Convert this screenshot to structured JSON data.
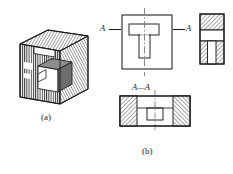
{
  "figure": {
    "type": "engineering-drawing",
    "captions": {
      "iso": "(a)",
      "ortho": "(b)"
    },
    "section_labels": {
      "left_marker": "A",
      "right_marker": "A",
      "section_title": "A—A"
    },
    "colors": {
      "line": "#1a1a1a",
      "hatch": "#2b2b2b",
      "background": "#ffffff",
      "centerline": "#7a7a7a",
      "shade_light": "#c8c8c8",
      "shade_mid": "#9a9a9a",
      "shade_dark": "#6e6e6e"
    },
    "views": [
      {
        "name": "isometric-cutaway",
        "label": "(a)",
        "position": {
          "x": 14,
          "y": 28,
          "w": 74,
          "h": 82
        }
      },
      {
        "name": "front-view",
        "label": "",
        "feature": "T-slot",
        "position": {
          "x": 122,
          "y": 15,
          "w": 50,
          "h": 54
        }
      },
      {
        "name": "side-section-view",
        "label": "",
        "feature": "hatched section with slot",
        "position": {
          "x": 200,
          "y": 14,
          "w": 24,
          "h": 50
        }
      },
      {
        "name": "section-a-a",
        "label": "A—A",
        "feature": "hatched walls with central cavity",
        "position": {
          "x": 120,
          "y": 96,
          "w": 70,
          "h": 30
        }
      }
    ]
  }
}
